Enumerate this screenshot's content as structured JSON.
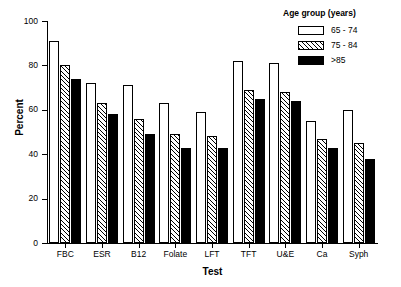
{
  "chart_data": {
    "type": "bar",
    "title": "",
    "xlabel": "Test",
    "ylabel": "Percent",
    "categories": [
      "FBC",
      "ESR",
      "B12",
      "Folate",
      "LFT",
      "TFT",
      "U&E",
      "Ca",
      "Syph"
    ],
    "series": [
      {
        "name": "65 - 74",
        "values": [
          91,
          72,
          71,
          63,
          59,
          82,
          81,
          55,
          60
        ]
      },
      {
        "name": "75 - 84",
        "values": [
          80,
          63,
          56,
          49,
          48,
          69,
          68,
          47,
          45
        ]
      },
      {
        "name": ">85",
        "values": [
          74,
          58,
          49,
          43,
          43,
          65,
          64,
          43,
          38
        ]
      }
    ],
    "ylim": [
      0,
      100
    ],
    "yticks": [
      0,
      20,
      40,
      60,
      80,
      100
    ],
    "ytick_labels": [
      "0",
      "20",
      "40",
      "60",
      "80",
      "100"
    ],
    "grid": false,
    "legend": {
      "title": "Age group (years)",
      "position": "top-right",
      "entries": [
        {
          "label": "65 - 74",
          "fill": "white",
          "color": "#ffffff"
        },
        {
          "label": "75 - 84",
          "fill": "hatched",
          "color": "#ffffff"
        },
        {
          "label": ">85",
          "fill": "solid",
          "color": "#000000"
        }
      ]
    },
    "colors": {
      "axis": "#000000",
      "bar_outline": "#000000",
      "series_1": "#ffffff",
      "series_2": "#ffffff",
      "series_3": "#000000",
      "background": "#ffffff"
    }
  }
}
